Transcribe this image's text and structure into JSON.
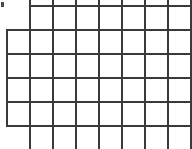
{
  "canvas": {
    "width": 192,
    "height": 149,
    "background_color": "#ffffff",
    "line_color": "#3a3a3a",
    "line_width": 2,
    "description": "Partial rectangular grid of cells, cropped at image edges"
  },
  "grid": {
    "vertical_spacing_px": 23,
    "horizontal_spacing_px": 24,
    "visible_columns": 8,
    "visible_rows": 5,
    "vertical_lines": [
      {
        "x": 6,
        "y_start": 29,
        "y_end": 127,
        "full_height": false
      },
      {
        "x": 29,
        "y_start": 0,
        "y_end": 149,
        "full_height": true
      },
      {
        "x": 52,
        "y_start": 0,
        "y_end": 149,
        "full_height": true
      },
      {
        "x": 75,
        "y_start": 0,
        "y_end": 149,
        "full_height": true
      },
      {
        "x": 98,
        "y_start": 0,
        "y_end": 149,
        "full_height": true
      },
      {
        "x": 121,
        "y_start": 0,
        "y_end": 149,
        "full_height": true
      },
      {
        "x": 144,
        "y_start": 0,
        "y_end": 149,
        "full_height": true
      },
      {
        "x": 167,
        "y_start": 0,
        "y_end": 149,
        "full_height": true
      },
      {
        "x": 190,
        "y_start": 0,
        "y_end": 149,
        "full_height": true
      }
    ],
    "horizontal_lines": [
      {
        "y": 5,
        "x_start": 29,
        "x_end": 192,
        "full_width": false
      },
      {
        "y": 29,
        "x_start": 6,
        "x_end": 192,
        "full_width": true
      },
      {
        "y": 53,
        "x_start": 6,
        "x_end": 192,
        "full_width": true
      },
      {
        "y": 77,
        "x_start": 6,
        "x_end": 192,
        "full_width": true
      },
      {
        "y": 101,
        "x_start": 6,
        "x_end": 192,
        "full_width": true
      },
      {
        "y": 125,
        "x_start": 6,
        "x_end": 192,
        "full_width": true
      }
    ]
  },
  "artifacts": [
    {
      "name": "top-left-mark",
      "x": 1,
      "y": 2,
      "width": 3,
      "height": 5,
      "color": "#4a4a4a"
    }
  ]
}
